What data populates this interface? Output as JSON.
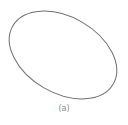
{
  "figure": {
    "shape": "ellipse",
    "center": [
      63,
      55
    ],
    "rx": 58,
    "ry": 38,
    "rotation_deg": 30,
    "stroke_color": "#6f6f6f",
    "stroke_width": 1,
    "fill": "none"
  },
  "caption": "(a)"
}
